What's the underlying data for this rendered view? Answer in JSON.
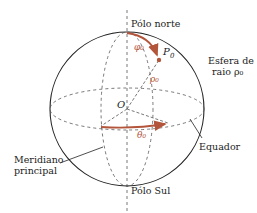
{
  "diagram": {
    "labels": {
      "north_pole": "Pólo norte",
      "south_pole": "Pólo Sul",
      "sphere_line1": "Esfera de",
      "sphere_line2": "raio ρ₀",
      "equator": "Equador",
      "meridian_line1": "Meridiano",
      "meridian_line2": "principal",
      "origin": "O",
      "point": "P",
      "point_sub": "0",
      "phi": "φ₀",
      "rho": "ρ₀",
      "theta": "θ₀"
    },
    "colors": {
      "outline": "#222222",
      "dashed": "#555555",
      "accent": "#b3553a"
    }
  }
}
